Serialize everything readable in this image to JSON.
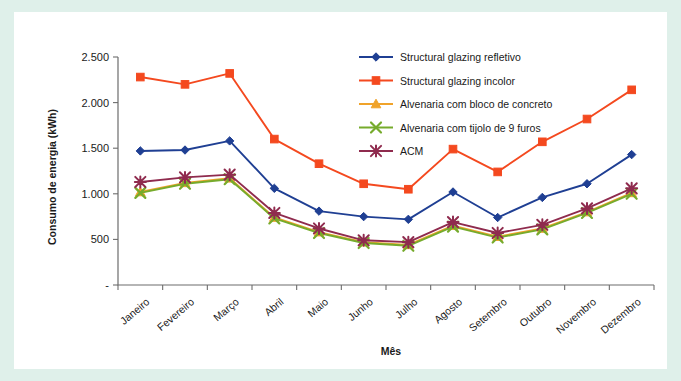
{
  "figure": {
    "border_color": "#dff0ea",
    "background": "#ffffff"
  },
  "chart_data": {
    "type": "line",
    "title": "",
    "xlabel": "Mês",
    "ylabel": "Consumo de energia (kWh)",
    "categories": [
      "Janeiro",
      "Fevereiro",
      "Março",
      "Abril",
      "Maio",
      "Junho",
      "Julho",
      "Agosto",
      "Setembro",
      "Outubro",
      "Novembro",
      "Dezembro"
    ],
    "ylim": [
      0,
      2500
    ],
    "yticks": [
      0,
      500,
      1000,
      1500,
      2000,
      2500
    ],
    "ytick_labels": [
      "-",
      "500",
      "1.000",
      "1.500",
      "2.000",
      "2.500"
    ],
    "grid": false,
    "legend_position": "top-center",
    "series": [
      {
        "name": "Structural glazing refletivo",
        "color": "#1f3f93",
        "marker": "diamond",
        "values": [
          1470,
          1480,
          1580,
          1060,
          810,
          750,
          720,
          1020,
          740,
          960,
          1110,
          1430
        ]
      },
      {
        "name": "Structural glazing incolor",
        "color": "#f4491f",
        "marker": "square",
        "values": [
          2280,
          2200,
          2320,
          1600,
          1330,
          1110,
          1050,
          1490,
          1240,
          1570,
          1820,
          2140
        ]
      },
      {
        "name": "Alvenaria com bloco de concreto",
        "color": "#f0a32a",
        "marker": "triangle",
        "values": [
          1020,
          1120,
          1170,
          740,
          580,
          470,
          440,
          650,
          530,
          620,
          800,
          1010
        ]
      },
      {
        "name": "Alvenaria com tijolo de 9 furos",
        "color": "#76ab2c",
        "marker": "cross-x",
        "values": [
          1010,
          1110,
          1160,
          730,
          570,
          460,
          430,
          640,
          520,
          610,
          790,
          1000
        ]
      },
      {
        "name": "ACM",
        "color": "#8f2b4e",
        "marker": "asterisk",
        "values": [
          1130,
          1180,
          1210,
          790,
          620,
          490,
          470,
          690,
          570,
          660,
          840,
          1060
        ]
      }
    ]
  }
}
